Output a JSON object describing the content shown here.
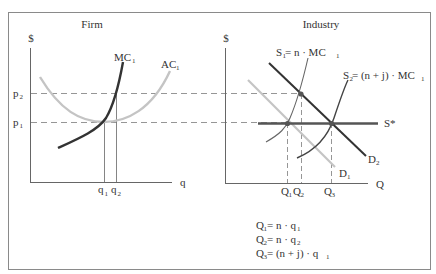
{
  "panels": {
    "firm": {
      "title": "Firm",
      "y_axis_label": "$",
      "x_axis_label": "q",
      "price_labels": [
        {
          "main": "p",
          "sub": "2"
        },
        {
          "main": "p",
          "sub": "1"
        }
      ],
      "quantity_labels": [
        {
          "main": "q",
          "sub": "1"
        },
        {
          "main": "q",
          "sub": "2"
        }
      ],
      "curves": [
        {
          "main": "MC",
          "sub": "1"
        },
        {
          "main": "AC",
          "sub": "1"
        }
      ]
    },
    "industry": {
      "title": "Industry",
      "y_axis_label": "$",
      "x_axis_label": "Q",
      "quantity_labels": [
        {
          "main": "Q",
          "sub": "1"
        },
        {
          "main": "Q",
          "sub": "2"
        },
        {
          "main": "Q",
          "sub": "3"
        }
      ],
      "curves": {
        "s1": {
          "main": "S",
          "sub": "1",
          "rest": " = n · MC",
          "rest_sub": "1"
        },
        "s2": {
          "main": "S",
          "sub": "2",
          "rest": " = (n + j) · MC",
          "rest_sub": "1"
        },
        "s_star": "S*",
        "d1": {
          "main": "D",
          "sub": "1"
        },
        "d2": {
          "main": "D",
          "sub": "2"
        }
      },
      "equations": [
        {
          "lhs": "Q",
          "lhs_sub": "1",
          "rhs": " = n · q",
          "rhs_sub": "1"
        },
        {
          "lhs": "Q",
          "lhs_sub": "2",
          "rhs": " = n · q",
          "rhs_sub": "2"
        },
        {
          "lhs": "Q",
          "lhs_sub": "3",
          "rhs": " = (n + j) · q",
          "rhs_sub": "1"
        }
      ]
    }
  },
  "colors": {
    "frame": "#8a8a8a",
    "axis": "#666666",
    "dark_curve": "#333333",
    "light_curve": "#c4c4c4",
    "dashed": "#8a8a8a",
    "point": "#555555"
  }
}
